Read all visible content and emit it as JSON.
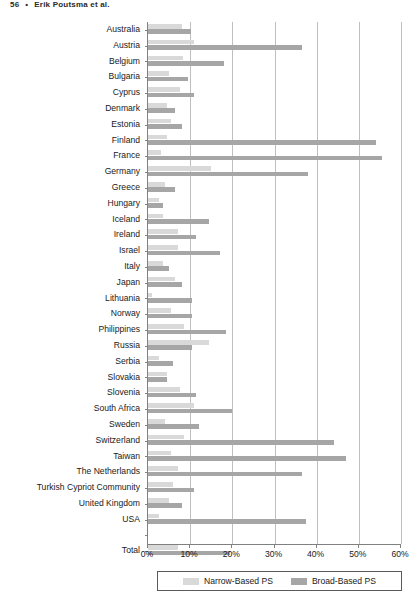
{
  "running_head": {
    "page_number": "56",
    "separator": "•",
    "authors": "Erik Poutsma et al."
  },
  "legend": {
    "narrow_label": "Narrow-Based PS",
    "broad_label": "Broad-Based PS",
    "narrow_color": "#d9d9d9",
    "broad_color": "#a6a6a6"
  },
  "axis": {
    "x_ticks": [
      "0%",
      "10%",
      "20%",
      "30%",
      "40%",
      "50%",
      "60%"
    ],
    "x_min": 0,
    "x_max": 60
  },
  "chart_data": {
    "type": "bar",
    "orientation": "horizontal",
    "title": "",
    "subtitle": "",
    "xlabel": "",
    "ylabel": "",
    "xlim": [
      0,
      60
    ],
    "grid": true,
    "legend_position": "bottom",
    "tick_format": "percent",
    "categories": [
      "Australia",
      "Austria",
      "Belgium",
      "Bulgaria",
      "Cyprus",
      "Denmark",
      "Estonia",
      "Finland",
      "France",
      "Germany",
      "Greece",
      "Hungary",
      "Iceland",
      "Ireland",
      "Israel",
      "Italy",
      "Japan",
      "Lithuania",
      "Norway",
      "Philippines",
      "Russia",
      "Serbia",
      "Slovakia",
      "Slovenia",
      "South Africa",
      "Sweden",
      "Switzerland",
      "Taiwan",
      "The Netherlands",
      "Turkish Cypriot Community",
      "United Kingdom",
      "USA",
      "",
      "Total"
    ],
    "series": [
      {
        "name": "Narrow-Based PS",
        "color": "#d9d9d9",
        "values": [
          8.0,
          11.0,
          8.2,
          5.0,
          7.5,
          4.5,
          5.5,
          4.5,
          3.0,
          15.0,
          4.0,
          2.5,
          3.5,
          7.0,
          7.0,
          3.5,
          6.5,
          1.0,
          5.5,
          8.5,
          14.5,
          2.5,
          4.5,
          7.5,
          11.0,
          4.0,
          8.5,
          5.5,
          7.0,
          6.0,
          5.0,
          2.5,
          null,
          7.0
        ]
      },
      {
        "name": "Broad-Based PS",
        "color": "#a6a6a6",
        "values": [
          10.2,
          36.5,
          18.0,
          9.5,
          11.0,
          6.5,
          8.0,
          54.0,
          55.5,
          38.0,
          6.5,
          3.5,
          14.5,
          11.5,
          17.0,
          5.0,
          8.0,
          10.5,
          10.5,
          18.5,
          10.5,
          6.0,
          4.5,
          11.5,
          20.0,
          12.0,
          44.0,
          47.0,
          36.5,
          11.0,
          8.0,
          37.5,
          null,
          19.5
        ]
      }
    ]
  }
}
